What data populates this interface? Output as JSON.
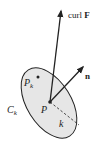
{
  "diagram": {
    "labels": {
      "curl": "curl",
      "F": "F",
      "n": "n",
      "P": "P",
      "Pk_base": "P",
      "Pk_sub": "k",
      "Ck_base": "C",
      "Ck_sub": "k",
      "k": "k"
    },
    "colors": {
      "disk_fill": "#e6e6e6",
      "stroke": "#222222"
    }
  }
}
